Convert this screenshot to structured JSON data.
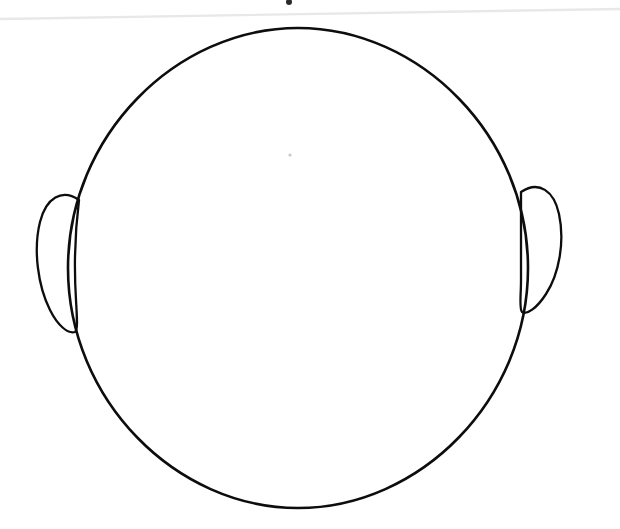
{
  "document": {
    "kind": "scanned-line-drawing",
    "title": "Blank Face Outline Template",
    "description": "Hand-drawn blank head outline with two ears on white paper",
    "canvas": {
      "width": 620,
      "height": 529,
      "background_color": "#ffffff"
    }
  },
  "style": {
    "ink_color": "#0d0d0d",
    "ink_stroke_width": 2.6,
    "ear_stroke_width": 2.3,
    "scan_line_color": "#e8e8e8",
    "scan_line_width": 2.4,
    "speck_color": "#2a2a2a",
    "faint_speck_color": "#c9c9c9"
  },
  "shapes": {
    "head": {
      "name": "head-outline",
      "type": "closed-oval",
      "center_x": 298,
      "center_y": 268,
      "radius_x": 230,
      "radius_y": 240,
      "bounds": {
        "left": 68,
        "top": 28,
        "right": 528,
        "bottom": 508
      },
      "path": "M 298 28 C 420 28 528 136 528 268 C 528 400 420 508 298 508 C 176 508 68 400 68 268 C 68 136 176 28 298 28 Z"
    },
    "left_ear": {
      "name": "left-ear-outline",
      "type": "teardrop",
      "side": "left",
      "bounds": {
        "left": 36,
        "top": 194,
        "right": 80,
        "bottom": 334
      },
      "path": "M 79 200 C 62 188 46 198 40 222 C 33 250 38 286 50 310 C 58 326 68 334 75 332 C 78 330 77 318 76 300 C 74 268 75 232 79 200 Z"
    },
    "right_ear": {
      "name": "right-ear-outline",
      "side": "right",
      "type": "teardrop",
      "bounds": {
        "left": 519,
        "top": 186,
        "right": 564,
        "bottom": 315
      },
      "path": "M 521 192 C 539 180 554 191 559 214 C 565 242 559 274 546 294 C 537 308 527 315 522 312 C 519 309 521 296 521 280 C 521 250 521 218 521 192 Z"
    },
    "scan_line": {
      "name": "scan-artifact-line",
      "type": "line",
      "x1": 0,
      "y1": 19,
      "x2": 620,
      "y2": 9
    },
    "ink_speck": {
      "name": "ink-speck",
      "type": "dot",
      "cx": 289,
      "cy": 2,
      "r": 3
    },
    "faint_speck": {
      "name": "faint-speck",
      "type": "dot",
      "cx": 290,
      "cy": 155,
      "r": 1.6
    }
  },
  "accessibility": {
    "alt_text": "Outline drawing of a blank human head facing forward, with an ear on each side and no facial features"
  }
}
